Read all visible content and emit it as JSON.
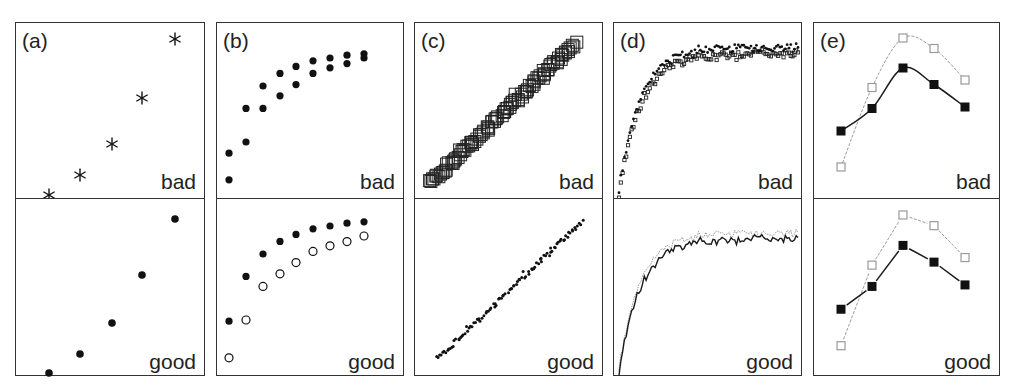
{
  "figure": {
    "layout": {
      "top": 22,
      "divider": 197,
      "bottom": 376,
      "panels_x": [
        [
          15,
          205
        ],
        [
          216,
          404
        ],
        [
          414,
          603
        ],
        [
          613,
          802
        ],
        [
          813,
          1000
        ]
      ]
    },
    "colors": {
      "ink": "#111111",
      "border": "#333333",
      "light": "#9a9a9a"
    }
  },
  "panels": [
    {
      "id": "a",
      "label": "(a)",
      "bad_label": "bad",
      "good_label": "good"
    },
    {
      "id": "b",
      "label": "(b)",
      "bad_label": "bad",
      "good_label": "good"
    },
    {
      "id": "c",
      "label": "(c)",
      "bad_label": "bad",
      "good_label": "good"
    },
    {
      "id": "d",
      "label": "(d)",
      "bad_label": "bad",
      "good_label": "good"
    },
    {
      "id": "e",
      "label": "(e)",
      "bad_label": "bad",
      "good_label": "good"
    }
  ],
  "chart_data": [
    {
      "panel": "(a)",
      "type": "scatter",
      "description": "Five points along an increasing curve; bad = asterisk markers, good = filled circles",
      "x": [
        1,
        2,
        3,
        4,
        5
      ],
      "bad": {
        "marker": "asterisk",
        "y": [
          0.0,
          0.12,
          0.3,
          0.57,
          1.0
        ]
      },
      "good": {
        "marker": "filled-circle",
        "y": [
          0.0,
          0.12,
          0.3,
          0.57,
          1.0
        ]
      },
      "annotations": [
        "bad",
        "good"
      ]
    },
    {
      "panel": "(b)",
      "type": "scatter",
      "description": "Two saturating series; bad = both filled circles, good = filled vs open circles",
      "x": [
        1,
        2,
        3,
        4,
        5,
        6,
        7,
        8,
        9
      ],
      "series": [
        {
          "name": "series1",
          "y": [
            0.27,
            0.59,
            0.75,
            0.84,
            0.89,
            0.93,
            0.95,
            0.97,
            0.98
          ]
        },
        {
          "name": "series2",
          "y": [
            0.08,
            0.35,
            0.59,
            0.68,
            0.76,
            0.84,
            0.88,
            0.91,
            0.95
          ]
        }
      ],
      "bad": {
        "markers": [
          "filled-circle",
          "filled-circle"
        ]
      },
      "good": {
        "markers": [
          "filled-circle",
          "open-circle"
        ]
      },
      "annotations": [
        "bad",
        "good"
      ]
    },
    {
      "panel": "(c)",
      "type": "scatter",
      "description": "~100 points along a linear trend; bad = large overlapping open squares, good = small dots",
      "trend": {
        "x_range": [
          0,
          1
        ],
        "y_range": [
          0,
          1
        ],
        "slope": 1,
        "noise": 0.04,
        "n": 100
      },
      "bad": {
        "marker": "open-square-large"
      },
      "good": {
        "marker": "small-dot"
      },
      "annotations": [
        "bad",
        "good"
      ]
    },
    {
      "panel": "(d)",
      "type": "line",
      "description": "Two noisy saturating series (~100 pts each); bad = overlapping small dots and squares, good = solid dark line vs light dotted line",
      "model": "y = 1 - exp(-x/0.12) with noise 0.03",
      "x_range": [
        0,
        1
      ],
      "y_range": [
        0,
        1
      ],
      "bad": {
        "markers": [
          "small-dot",
          "small-open-square"
        ]
      },
      "good": {
        "styles": [
          "solid-dark-line",
          "dotted-light-line"
        ]
      },
      "annotations": [
        "bad",
        "good"
      ]
    },
    {
      "panel": "(e)",
      "type": "line",
      "description": "Two 5-point series; bad = smoothed curves, good = straight segments. Dark filled squares vs light open squares.",
      "x": [
        1,
        2,
        3,
        4,
        5
      ],
      "series": [
        {
          "name": "dark",
          "marker": "filled-square",
          "y": [
            0.38,
            0.53,
            0.8,
            0.69,
            0.54
          ]
        },
        {
          "name": "light",
          "marker": "open-square",
          "y": [
            0.14,
            0.67,
            1.0,
            0.93,
            0.72
          ]
        }
      ],
      "bad": {
        "line": "smoothed"
      },
      "good": {
        "line": "straight"
      },
      "annotations": [
        "bad",
        "good"
      ]
    }
  ]
}
